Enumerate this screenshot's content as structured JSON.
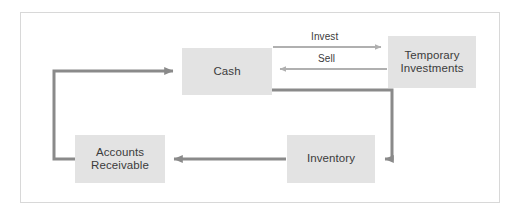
{
  "diagram": {
    "frame": {
      "border_color": "#d8d8d8",
      "background": "#ffffff"
    },
    "style": {
      "node_fill": "#e3e3e3",
      "node_text_color": "#3b3b3b",
      "thick_connector_color": "#8a8a8a",
      "thin_connector_color": "#b0b0b0"
    },
    "nodes": [
      {
        "id": "cash",
        "label": "Cash"
      },
      {
        "id": "temporary_investments",
        "label": "Temporary\nInvestments",
        "line1": "Temporary",
        "line2": "Investments"
      },
      {
        "id": "accounts_receivable",
        "label": "Accounts\nReceivable",
        "line1": "Accounts",
        "line2": "Receivable"
      },
      {
        "id": "inventory",
        "label": "Inventory"
      }
    ],
    "edges": [
      {
        "id": "invest",
        "from": "cash",
        "to": "temporary_investments",
        "label": "Invest",
        "direction": "right",
        "weight": "thin"
      },
      {
        "id": "sell",
        "from": "temporary_investments",
        "to": "cash",
        "label": "Sell",
        "direction": "left",
        "weight": "thin"
      },
      {
        "id": "cash-to-inventory",
        "from": "cash",
        "to": "inventory",
        "label": "",
        "direction": "left",
        "weight": "thick"
      },
      {
        "id": "inventory-to-accounts-receivable",
        "from": "inventory",
        "to": "accounts_receivable",
        "label": "",
        "direction": "left",
        "weight": "thick"
      },
      {
        "id": "accounts-receivable-to-cash",
        "from": "accounts_receivable",
        "to": "cash",
        "label": "",
        "direction": "right",
        "weight": "thick"
      }
    ]
  }
}
